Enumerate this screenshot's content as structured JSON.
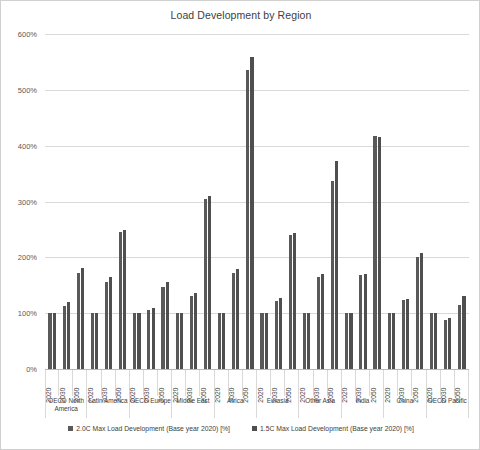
{
  "chart_data": {
    "type": "bar",
    "title": "Load Development by Region",
    "xlabel": "",
    "ylabel": "",
    "ylim": [
      0,
      600
    ],
    "y_tick_labels": [
      "0%",
      "100%",
      "200%",
      "300%",
      "400%",
      "500%",
      "600%"
    ],
    "y_tick_values": [
      0,
      100,
      200,
      300,
      400,
      500,
      600
    ],
    "grid": true,
    "legend_position": "bottom",
    "regions": [
      "OECD North America",
      "Latin America",
      "OECD Europe",
      "Middle East",
      "Africa",
      "Eurasia",
      "Other Asia",
      "India",
      "China",
      "OECD Pacific"
    ],
    "years": [
      "2020",
      "2030",
      "2050"
    ],
    "categories": [
      "OECD North America 2020",
      "OECD North America 2030",
      "OECD North America 2050",
      "Latin America 2020",
      "Latin America 2030",
      "Latin America 2050",
      "OECD Europe 2020",
      "OECD Europe 2030",
      "OECD Europe 2050",
      "Middle East 2020",
      "Middle East 2030",
      "Middle East 2050",
      "Africa 2020",
      "Africa 2030",
      "Africa 2050",
      "Eurasia 2020",
      "Eurasia 2030",
      "Eurasia 2050",
      "Other Asia 2020",
      "Other Asia 2030",
      "Other Asia 2050",
      "India 2020",
      "India 2030",
      "India 2050",
      "China 2020",
      "China 2030",
      "China 2050",
      "OECD Pacific 2020",
      "OECD Pacific 2030",
      "OECD Pacific 2050"
    ],
    "series": [
      {
        "name": "2.0C Max Load Development (Base year 2020) [%]",
        "color": "#595959",
        "values": [
          100,
          112,
          172,
          100,
          155,
          245,
          100,
          105,
          147,
          100,
          131,
          305,
          100,
          172,
          535,
          100,
          121,
          240,
          100,
          165,
          336,
          100,
          168,
          418,
          100,
          123,
          200,
          100,
          88,
          115
        ]
      },
      {
        "name": "1.5C Max Load Development (Base year 2020) [%]",
        "color": "#4f4f4f",
        "values": [
          100,
          120,
          181,
          100,
          165,
          249,
          100,
          110,
          156,
          100,
          136,
          310,
          100,
          180,
          558,
          100,
          127,
          243,
          100,
          170,
          373,
          100,
          171,
          415,
          100,
          126,
          207,
          100,
          92,
          130
        ]
      }
    ]
  },
  "legend": {
    "items": [
      {
        "label": "2.0C Max Load Development (Base year 2020) [%]"
      },
      {
        "label": "1.5C Max Load Development (Base year 2020) [%]"
      }
    ]
  }
}
